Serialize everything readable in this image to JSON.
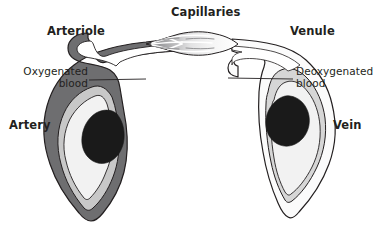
{
  "figure": {
    "background_color": "#ffffff",
    "text_color": "#231f20"
  },
  "labels": {
    "arteriole": "Arteriole",
    "capillaries": "Capillaries",
    "venule": "Venule",
    "artery": "Artery",
    "vein": "Vein",
    "oxygenated": "Oxygenated\nblood",
    "deoxygenated": "Deoxygenated\nblood"
  },
  "colors": {
    "outline": "#231f20",
    "artery_outer_wall": "#6e6e70",
    "artery_middle_layer": "#c8c8c8",
    "artery_lumen": "#f2f2f2",
    "vein_outer_wall": "#fbfbfb",
    "vein_middle_layer": "#d6d6d6",
    "vein_lumen": "#f2f2f2",
    "blood_mass": "#1a1a1a",
    "arteriole_tube": "#6e6e70",
    "venule_tube": "#fbfbfb",
    "capillary_light": "#ffffff",
    "capillary_dark": "#808082",
    "leader_line": "#231f20"
  },
  "leader_lines": {
    "oxygenated": {
      "x1": 89,
      "y1": 80,
      "x2": 146,
      "y2": 79
    },
    "deoxygenated": {
      "x1": 228,
      "y1": 78,
      "x2": 293,
      "y2": 79
    }
  }
}
